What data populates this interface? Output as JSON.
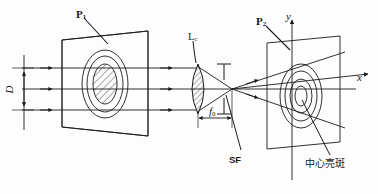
{
  "figure": {
    "type": "optical-diagram",
    "background_color": "#fdfdfd",
    "line_color": "#1a1a1a"
  },
  "labels": {
    "plane1": {
      "text": "P",
      "sub": "1",
      "x": 76,
      "y": 9
    },
    "plane2": {
      "text": "P",
      "sub": "2",
      "x": 256,
      "y": 16
    },
    "lens": {
      "text": "L",
      "sub": "c",
      "x": 188,
      "y": 32
    },
    "aperture_diameter": {
      "text": "D",
      "x": 8,
      "y": 86
    },
    "focal_length": {
      "text": "f",
      "sub": "0",
      "x": 209,
      "y": 113
    },
    "spatial_filter": {
      "text": "SF",
      "x": 229,
      "y": 155
    },
    "axis_x": {
      "text": "x",
      "x": 357,
      "y": 73
    },
    "axis_y": {
      "text": "y",
      "x": 287,
      "y": 12
    },
    "center_bright_spot": {
      "text": "中心亮斑",
      "x": 305,
      "y": 160
    }
  },
  "geometry": {
    "object_plane": {
      "name": "P1",
      "corners": "62,40 148,31 148,136 62,127",
      "rings": [
        {
          "cx": 105,
          "cy": 84,
          "rx": 23,
          "ry": 34
        },
        {
          "cx": 105,
          "cy": 84,
          "rx": 17,
          "ry": 27
        },
        {
          "cx": 105,
          "cy": 84,
          "rx": 11,
          "ry": 19
        }
      ],
      "hatched_center": true
    },
    "image_plane": {
      "name": "P2",
      "corners": "267,43 340,36 340,142 267,149",
      "rings": [
        {
          "cx": 301,
          "cy": 96,
          "rx": 21,
          "ry": 32
        },
        {
          "cx": 301,
          "cy": 96,
          "rx": 16,
          "ry": 25
        },
        {
          "cx": 301,
          "cy": 96,
          "rx": 11,
          "ry": 17
        },
        {
          "cx": 301,
          "cy": 96,
          "rx": 6,
          "ry": 10
        }
      ]
    },
    "lens": {
      "name": "Lc",
      "apex_top_y": 65,
      "apex_bottom_y": 112,
      "center_x": 198,
      "hatched": true
    },
    "focal_point": {
      "x": 232,
      "y": 89
    },
    "ray_y_positions": [
      68,
      89,
      110
    ],
    "beam_left_x": 22,
    "dimension_D": {
      "x": 24,
      "y_top": 68,
      "y_bottom": 118
    },
    "dimension_f0": {
      "y": 118,
      "x_left": 198,
      "x_right": 232
    }
  }
}
